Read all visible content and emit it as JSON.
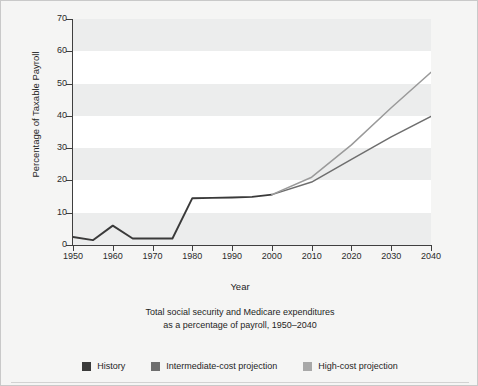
{
  "chart_data": {
    "type": "line",
    "title": "",
    "caption_line1": "Total social security and Medicare expenditures",
    "caption_line2": "as a percentage of payroll, 1950–2040",
    "xlabel": "Year",
    "ylabel": "Percentage of Taxable Payroll",
    "xlim": [
      1950,
      2040
    ],
    "ylim": [
      0,
      70
    ],
    "xticks": [
      1950,
      1960,
      1970,
      1980,
      1990,
      2000,
      2010,
      2020,
      2030,
      2040
    ],
    "yticks": [
      0,
      10,
      20,
      30,
      40,
      50,
      60,
      70
    ],
    "grid": false,
    "banded_background": true,
    "legend_position": "bottom",
    "series": [
      {
        "name": "History",
        "color": "#3a3a3a",
        "x": [
          1950,
          1955,
          1960,
          1965,
          1970,
          1975,
          1980,
          1985,
          1990,
          1995,
          2000
        ],
        "values": [
          2.5,
          1.5,
          6.0,
          2.0,
          2.0,
          2.0,
          14.5,
          14.6,
          14.7,
          14.9,
          15.6
        ]
      },
      {
        "name": "Intermediate-cost projection",
        "color": "#6e6e6e",
        "x": [
          2000,
          2010,
          2020,
          2030,
          2040
        ],
        "values": [
          15.6,
          19.5,
          26.5,
          33.5,
          39.8
        ]
      },
      {
        "name": "High-cost projection",
        "color": "#9a9a9a",
        "x": [
          2000,
          2010,
          2020,
          2030,
          2040
        ],
        "values": [
          15.6,
          21.0,
          31.0,
          42.5,
          53.5
        ]
      }
    ]
  },
  "axis": {
    "y_tick_labels": [
      "0",
      "10",
      "20",
      "30",
      "40",
      "50",
      "60",
      "70"
    ],
    "x_tick_labels": [
      "1950",
      "1960",
      "1970",
      "1980",
      "1990",
      "2000",
      "2010",
      "2020",
      "2030",
      "2040"
    ],
    "y_title": "Percentage of Taxable Payroll",
    "x_title": "Year"
  },
  "caption": {
    "line1": "Total social security and Medicare expenditures",
    "line2": "as a percentage of payroll, 1950–2040"
  },
  "legend": {
    "items": [
      {
        "label": "History",
        "color": "#3a3a3a"
      },
      {
        "label": "Intermediate-cost projection",
        "color": "#6e6e6e"
      },
      {
        "label": "High-cost projection",
        "color": "#a8a8a8"
      }
    ]
  }
}
